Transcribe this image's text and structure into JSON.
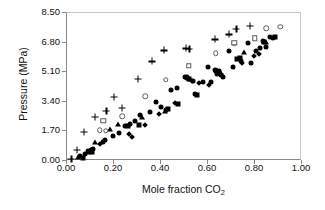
{
  "chart_data": {
    "type": "scatter",
    "title": "",
    "xlabel": "Mole fraction CO2",
    "xlabel_base": "Mole fraction CO",
    "xlabel_sub": "2",
    "ylabel": "Pressure (MPa)",
    "xlim": [
      0.0,
      1.0
    ],
    "ylim": [
      0.0,
      8.5
    ],
    "xticks": [
      "0.00",
      "0.20",
      "0.40",
      "0.60",
      "0.80",
      "1.00"
    ],
    "xtick_values": [
      0.0,
      0.2,
      0.4,
      0.6,
      0.8,
      1.0
    ],
    "yticks": [
      "0.00",
      "1.70",
      "3.40",
      "5.10",
      "6.80",
      "8.50"
    ],
    "ytick_values": [
      0.0,
      1.7,
      3.4,
      5.1,
      6.8,
      8.5
    ],
    "grid": false,
    "legend": "none",
    "marker_color": "#000000",
    "open_marker_edge": "#5a5a5a",
    "series": [
      {
        "name": "filled-circle",
        "marker": "fcircle",
        "points": [
          [
            0.055,
            0.3
          ],
          [
            0.075,
            0.42
          ],
          [
            0.088,
            0.55
          ],
          [
            0.102,
            0.62
          ],
          [
            0.112,
            0.7
          ],
          [
            0.152,
            1.12
          ],
          [
            0.163,
            1.2
          ],
          [
            0.197,
            1.42
          ],
          [
            0.223,
            1.63
          ],
          [
            0.245,
            2.0
          ],
          [
            0.268,
            2.12
          ],
          [
            0.288,
            2.3
          ],
          [
            0.312,
            2.62
          ],
          [
            0.355,
            2.8
          ],
          [
            0.378,
            3.38
          ],
          [
            0.398,
            3.08
          ],
          [
            0.422,
            2.95
          ],
          [
            0.443,
            4.05
          ],
          [
            0.468,
            4.2
          ],
          [
            0.5,
            4.82
          ],
          [
            0.512,
            4.8
          ],
          [
            0.518,
            4.7
          ],
          [
            0.536,
            4.62
          ],
          [
            0.545,
            3.85
          ],
          [
            0.578,
            4.55
          ],
          [
            0.6,
            5.42
          ],
          [
            0.612,
            4.55
          ],
          [
            0.628,
            5.25
          ],
          [
            0.64,
            5.02
          ],
          [
            0.648,
            5.18
          ],
          [
            0.655,
            4.92
          ],
          [
            0.662,
            4.85
          ],
          [
            0.688,
            6.32
          ],
          [
            0.708,
            5.38
          ],
          [
            0.73,
            5.85
          ],
          [
            0.742,
            5.75
          ],
          [
            0.77,
            6.78
          ],
          [
            0.782,
            5.65
          ],
          [
            0.805,
            6.32
          ],
          [
            0.822,
            6.5
          ],
          [
            0.835,
            6.92
          ],
          [
            0.848,
            6.55
          ],
          [
            0.862,
            7.1
          ],
          [
            0.878,
            7.05
          ]
        ]
      },
      {
        "name": "filled-square",
        "marker": "fsquare",
        "points": [
          [
            0.07,
            0.18
          ],
          [
            0.095,
            0.5
          ],
          [
            0.105,
            0.52
          ],
          [
            0.258,
            2.02
          ],
          [
            0.308,
            2.08
          ],
          [
            0.43,
            3.0
          ],
          [
            0.472,
            3.28
          ],
          [
            0.52,
            4.7
          ],
          [
            0.555,
            3.78
          ],
          [
            0.648,
            5.05
          ],
          [
            0.725,
            5.88
          ],
          [
            0.735,
            5.9
          ],
          [
            0.84,
            6.82
          ],
          [
            0.885,
            7.12
          ]
        ]
      },
      {
        "name": "filled-triangle",
        "marker": "ftri",
        "points": [
          [
            0.048,
            0.22
          ],
          [
            0.12,
            1.1
          ],
          [
            0.182,
            1.82
          ],
          [
            0.215,
            2.15
          ],
          [
            0.318,
            2.55
          ],
          [
            0.415,
            2.9
          ],
          [
            0.64,
            5.22
          ],
          [
            0.755,
            6.25
          ],
          [
            0.848,
            6.82
          ]
        ]
      },
      {
        "name": "filled-diamond",
        "marker": "fdia",
        "points": [
          [
            0.1,
            0.58
          ],
          [
            0.142,
            0.98
          ],
          [
            0.262,
            1.55
          ],
          [
            0.275,
            1.38
          ],
          [
            0.332,
            2.05
          ],
          [
            0.392,
            2.68
          ],
          [
            0.458,
            3.32
          ],
          [
            0.508,
            4.78
          ],
          [
            0.532,
            4.62
          ],
          [
            0.562,
            4.48
          ],
          [
            0.605,
            4.38
          ],
          [
            0.632,
            5.1
          ],
          [
            0.655,
            4.98
          ],
          [
            0.745,
            5.62
          ],
          [
            0.795,
            6.05
          ],
          [
            0.818,
            6.12
          ]
        ]
      },
      {
        "name": "plus",
        "marker": "plus",
        "points": [
          [
            0.018,
            0.12
          ],
          [
            0.042,
            0.65
          ],
          [
            0.072,
            1.68
          ],
          [
            0.118,
            2.55
          ],
          [
            0.168,
            2.88
          ],
          [
            0.198,
            3.68
          ],
          [
            0.232,
            3.05
          ],
          [
            0.302,
            4.72
          ],
          [
            0.36,
            5.72
          ],
          [
            0.412,
            6.35
          ],
          [
            0.505,
            6.48
          ],
          [
            0.52,
            6.45
          ],
          [
            0.63,
            6.98
          ],
          [
            0.688,
            7.28
          ],
          [
            0.72,
            7.58
          ],
          [
            0.778,
            7.78
          ]
        ]
      },
      {
        "name": "open-circle",
        "marker": "ocircle",
        "points": [
          [
            0.14,
            1.78
          ],
          [
            0.165,
            1.75
          ],
          [
            0.235,
            2.58
          ],
          [
            0.332,
            3.72
          ],
          [
            0.42,
            4.68
          ],
          [
            0.632,
            6.2
          ],
          [
            0.712,
            6.72
          ],
          [
            0.848,
            7.62
          ],
          [
            0.908,
            7.72
          ]
        ]
      },
      {
        "name": "open-square",
        "marker": "osquare",
        "points": [
          [
            0.155,
            2.3
          ],
          [
            0.518,
            5.48
          ],
          [
            0.712,
            6.78
          ],
          [
            0.798,
            7.05
          ]
        ]
      }
    ]
  }
}
